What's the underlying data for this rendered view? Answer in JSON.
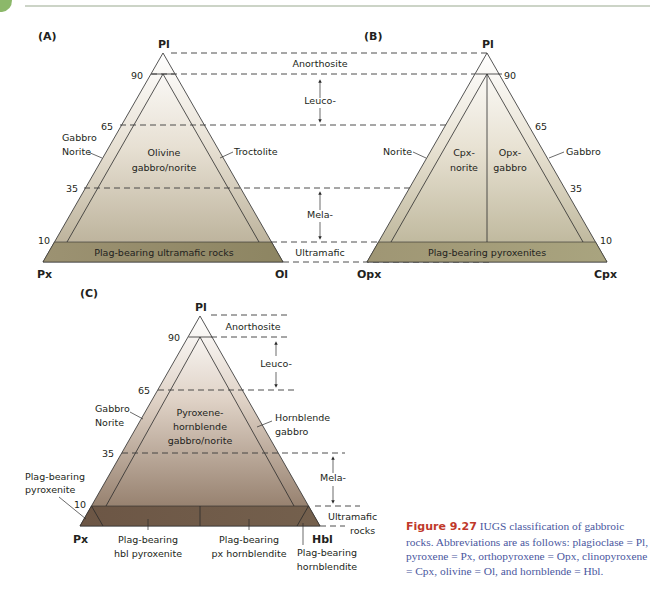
{
  "header": {
    "accent_color": "#8cb86a",
    "rule_color": "#9aaa90"
  },
  "colors": {
    "fill_top": "#ffffff",
    "fill_A_bottom": "#9e9374",
    "fill_B_bottom": "#a89f7c",
    "fill_C_bottom": "#6f5a48",
    "caption_text": "#4a57a0",
    "caption_figure_label": "#c0392b"
  },
  "panels": {
    "A": {
      "label": "(A)",
      "apex_top": "Pl",
      "apex_left": "Px",
      "apex_right": "Ol",
      "ticks": [
        "90",
        "65",
        "35",
        "10"
      ],
      "fields": {
        "center_line1": "Olivine",
        "center_line2": "gabbro/norite",
        "left_edge_line1": "Gabbro",
        "left_edge_line2": "Norite",
        "right_edge": "Troctolite",
        "bottom_band": "Plag-bearing ultramafic rocks"
      }
    },
    "B": {
      "label": "(B)",
      "apex_top": "Pl",
      "apex_left": "Opx",
      "apex_right": "Cpx",
      "ticks": [
        "90",
        "65",
        "35",
        "10"
      ],
      "fields": {
        "left_center_line1": "Cpx-",
        "left_center_line2": "norite",
        "right_center_line1": "Opx-",
        "right_center_line2": "gabbro",
        "left_edge": "Norite",
        "right_edge": "Gabbro",
        "bottom_band": "Plag-bearing pyroxenites"
      }
    },
    "AB_ranges": {
      "anorthosite": "Anorthosite",
      "leuco": "Leuco-",
      "mela": "Mela-",
      "ultramafic": "Ultramafic"
    },
    "C": {
      "label": "(C)",
      "apex_top": "Pl",
      "apex_left": "Px",
      "apex_right": "Hbl",
      "ticks": [
        "90",
        "65",
        "35",
        "10"
      ],
      "ranges": {
        "anorthosite": "Anorthosite",
        "leuco": "Leuco-",
        "mela": "Mela-",
        "ultramafic_line1": "Ultramafic",
        "ultramafic_line2": "rocks"
      },
      "fields": {
        "center_line1": "Pyroxene-",
        "center_line2": "hornblende",
        "center_line3": "gabbro/norite",
        "left_edge_line1": "Gabbro",
        "left_edge_line2": "Norite",
        "right_edge_line1": "Hornblende",
        "right_edge_line2": "gabbro",
        "left_corner_line1": "Plag-bearing",
        "left_corner_line2": "pyroxenite",
        "bottom_left_line1": "Plag-bearing",
        "bottom_left_line2": "hbl pyroxenite",
        "bottom_right_line1": "Plag-bearing",
        "bottom_right_line2": "px hornblendite",
        "right_corner_line1": "Plag-bearing",
        "right_corner_line2": "hornblendite"
      }
    }
  },
  "caption": {
    "figure_label": "Figure 9.27",
    "title": "IUGS classification of gabbroic rocks.",
    "body": "Abbreviations are as follows: plagioclase = Pl, pyroxene = Px, orthopyroxene = Opx, clinopyroxene = Cpx, olivine = Ol, and hornblende = Hbl."
  }
}
